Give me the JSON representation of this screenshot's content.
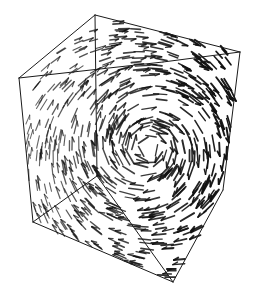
{
  "figure": {
    "background_color": "#ffffff",
    "line_color": "#1a1a1a",
    "glyph_color": "#111111",
    "width": 255,
    "height": 297
  },
  "bounding_box": {
    "name": "wireframe-cube",
    "stroke": "#1a1a1a",
    "stroke_width": 1,
    "vertices": {
      "back_top_left": [
        19,
        78
      ],
      "back_top_right": [
        95,
        15
      ],
      "front_top_left": [
        163,
        62
      ],
      "front_top_right": [
        240,
        52
      ],
      "back_bottom_left": [
        33,
        222
      ],
      "back_bottom_right": [
        97,
        176
      ],
      "front_bottom_left": [
        173,
        282
      ],
      "front_bottom_right": [
        223,
        190
      ]
    },
    "edges": [
      [
        "back_top_left",
        "back_top_right"
      ],
      [
        "back_top_right",
        "front_top_right"
      ],
      [
        "back_top_left",
        "front_top_left"
      ],
      [
        "front_top_left",
        "front_top_right"
      ],
      [
        "back_top_left",
        "back_bottom_left"
      ],
      [
        "back_top_right",
        "back_bottom_right"
      ],
      [
        "front_top_right",
        "front_bottom_right"
      ],
      [
        "back_bottom_left",
        "front_bottom_left"
      ],
      [
        "front_bottom_left",
        "front_bottom_right"
      ],
      [
        "back_bottom_left",
        "back_bottom_right"
      ],
      [
        "back_bottom_right",
        "front_bottom_left"
      ]
    ]
  },
  "chart_data": {
    "type": "scatter",
    "xlabel": "",
    "ylabel": "",
    "field_model": {
      "kind": "vortex",
      "center_x": 148,
      "center_y": 148,
      "core_radius": 18,
      "outer_radius": 132,
      "rotation_direction": "counter-clockwise",
      "glyph_count": 760,
      "glyph_min_length": 3,
      "glyph_max_length": 16,
      "glyph_min_width": 0.8,
      "glyph_max_width": 2.1,
      "seed": 20240517,
      "depth_fade_axis": "x",
      "depth_fade_low": 0.28,
      "depth_fade_high": 1.0
    },
    "legend": [],
    "grid": false,
    "annotations": []
  }
}
